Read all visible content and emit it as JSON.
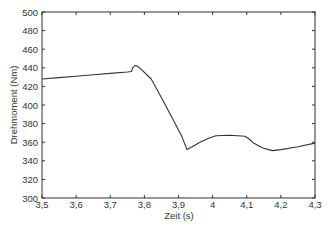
{
  "chart_data": {
    "type": "line",
    "title": "",
    "xlabel": "Zeit (s)",
    "ylabel": "Drehmoment (Nm)",
    "xlim": [
      3.5,
      4.3
    ],
    "ylim": [
      300,
      500
    ],
    "grid": false,
    "legend": null,
    "x_ticks": [
      3.5,
      3.6,
      3.7,
      3.8,
      3.9,
      4.0,
      4.1,
      4.2,
      4.3
    ],
    "x_tick_labels": [
      "3,5",
      "3,6",
      "3,7",
      "3,8",
      "3,9",
      "4",
      "4,1",
      "4,2",
      "4,3"
    ],
    "y_ticks": [
      300,
      320,
      340,
      360,
      380,
      400,
      420,
      440,
      460,
      480,
      500
    ],
    "y_tick_labels": [
      "300",
      "320",
      "340",
      "360",
      "380",
      "400",
      "420",
      "440",
      "460",
      "480",
      "500"
    ],
    "series": [
      {
        "name": "Drehmoment",
        "color": "#333333",
        "x": [
          3.5,
          3.55,
          3.6,
          3.65,
          3.7,
          3.75,
          3.762,
          3.766,
          3.772,
          3.778,
          3.784,
          3.79,
          3.82,
          3.85,
          3.88,
          3.91,
          3.925,
          3.94,
          3.963,
          3.99,
          4.01,
          4.05,
          4.095,
          4.105,
          4.12,
          4.145,
          4.175,
          4.2,
          4.25,
          4.3
        ],
        "values": [
          428,
          429.5,
          431,
          432.5,
          434,
          435.5,
          436,
          440,
          442.5,
          442,
          440.5,
          438.5,
          428,
          408,
          387,
          366,
          352,
          355,
          360,
          364.5,
          367,
          367.5,
          366.5,
          364,
          359,
          354,
          351,
          352,
          355,
          359
        ]
      }
    ]
  }
}
